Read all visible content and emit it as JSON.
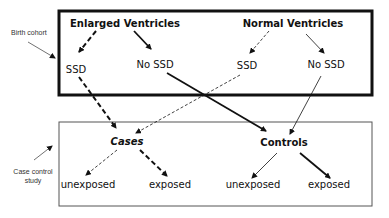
{
  "side_labels": {
    "birth_cohort": "Birth cohort",
    "case_control_line1": "Case control",
    "case_control_line2": "study"
  },
  "birth_cohort_box": {
    "enlarged_ventricles": "Enlarged Ventricles",
    "normal_ventricles": "Normal Ventricles",
    "enlarged_ssd": "SSD",
    "enlarged_no_ssd": "No SSD",
    "normal_ssd": "SSD",
    "normal_no_ssd": "No SSD"
  },
  "case_control_box": {
    "cases": "Cases",
    "controls": "Controls",
    "cases_unexposed": "unexposed",
    "cases_exposed": "exposed",
    "controls_unexposed": "unexposed",
    "controls_exposed": "exposed"
  }
}
